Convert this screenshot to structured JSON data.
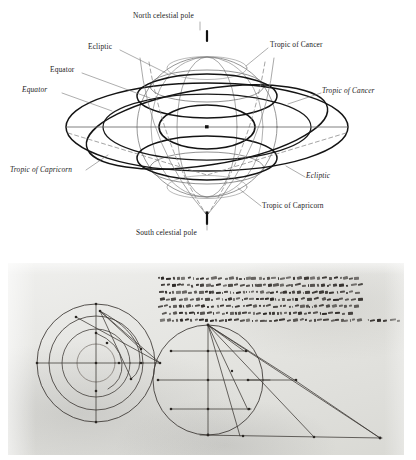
{
  "figure": {
    "panels": [
      {
        "id": "celestial-sphere",
        "kind": "line-diagram"
      },
      {
        "id": "manuscript-folio",
        "kind": "photograph"
      }
    ]
  },
  "sphere_diagram": {
    "title": "Celestial sphere with equator, ecliptic and tropics",
    "labels": [
      {
        "key": "north_pole",
        "text": "North celestial pole",
        "style": "roman",
        "x": 133,
        "y": 14,
        "anchor": "start"
      },
      {
        "key": "ecliptic_upper",
        "text": "Ecliptic",
        "style": "roman",
        "x": 88,
        "y": 47,
        "anchor": "start"
      },
      {
        "key": "equator_roman",
        "text": "Equator",
        "style": "roman",
        "x": 50,
        "y": 70,
        "anchor": "start"
      },
      {
        "key": "equator_italic",
        "text": "Equator",
        "style": "italic",
        "x": 26,
        "y": 90,
        "anchor": "start"
      },
      {
        "key": "cancer_roman",
        "text": "Tropic of Cancer",
        "style": "roman",
        "x": 270,
        "y": 44,
        "anchor": "start"
      },
      {
        "key": "cancer_italic",
        "text": "Tropic of Cancer",
        "style": "italic",
        "x": 323,
        "y": 91,
        "anchor": "start"
      },
      {
        "key": "capricorn_italic",
        "text": "Tropic of Capricorn",
        "style": "italic",
        "x": 12,
        "y": 172,
        "anchor": "start"
      },
      {
        "key": "ecliptic_lower",
        "text": "Ecliptic",
        "style": "italic",
        "x": 307,
        "y": 178,
        "anchor": "start"
      },
      {
        "key": "capricorn_roman",
        "text": "Tropic of Capricorn",
        "style": "roman",
        "x": 263,
        "y": 207,
        "anchor": "start"
      },
      {
        "key": "south_pole",
        "text": "South celestial pole",
        "style": "roman",
        "x": 136,
        "y": 232,
        "anchor": "start"
      }
    ],
    "colors": {
      "ink": "#1b1b1b",
      "heavy_stroke": "#111111",
      "light_stroke": "#5c5c5c",
      "dashed_stroke": "#6a6a6a",
      "background": "#ffffff"
    },
    "geometry": {
      "center": {
        "x": 207,
        "y": 127
      },
      "sphere_radius": 70,
      "horizon_half_width": 141,
      "axis_tilt_deg": 23.5,
      "pole_tick_top_y": 34,
      "pole_tick_bottom_y": 221
    },
    "elements": [
      "outer sphere outline circle",
      "celestial equator ellipse (heavy)",
      "ecliptic ellipse (heavy, tilted)",
      "tropic of Cancer ellipse (light, upper)",
      "tropic of Capricorn ellipse (light, lower)",
      "horizon / equatorial plane ellipse (heavy, wide)",
      "polar axis with end ticks",
      "dashed meridian arcs converging at south pole",
      "centre point marker"
    ]
  },
  "manuscript": {
    "description": "Medieval Latin manuscript folio with two geometric astronomical diagrams and a block of cursive Latin text",
    "script": "Gothic cursive, brown iron-gall ink",
    "colors": {
      "parchment_light": "#efefed",
      "parchment_mid": "#e3e3df",
      "parchment_dark": "#d9d9d4",
      "ink": "#2b2724",
      "drawn_line": "#3a3531"
    },
    "left_diagram": {
      "kind": "concentric-circles-with-axes",
      "circle_count": 4,
      "has_vertical_axis": true,
      "has_horizontal_axis": true,
      "point_labels": [
        "a",
        "b",
        "c",
        "d",
        "e",
        "f",
        "g",
        "h",
        "k",
        "l",
        "m",
        "n"
      ]
    },
    "right_diagram": {
      "kind": "circle-with-chords-and-projection-rays",
      "chord_count": 3,
      "has_vertical_diameter": true,
      "has_baseline": true,
      "ray_count": 5,
      "point_labels": [
        "a",
        "b",
        "c",
        "d",
        "e",
        "f",
        "g",
        "h",
        "k",
        "l",
        "m",
        "n",
        "o"
      ]
    },
    "text_block": {
      "line_count": 7,
      "legible": false,
      "marginal_note": true
    }
  }
}
